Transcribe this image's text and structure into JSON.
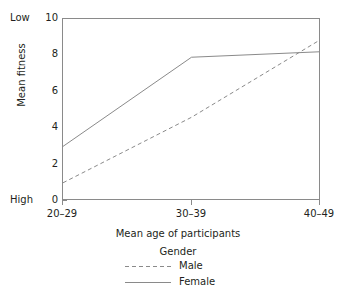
{
  "chart_data": {
    "type": "line",
    "title": "",
    "xlabel": "Mean age of participants",
    "ylabel": "Mean fitness",
    "categories": [
      "20–29",
      "30–39",
      "40–49"
    ],
    "yticks": [
      0,
      2,
      4,
      6,
      8,
      10
    ],
    "ylim": [
      0,
      10
    ],
    "grid": false,
    "axis_annotations": {
      "y_top": "Low",
      "y_bottom": "High"
    },
    "legend": {
      "title": "Gender",
      "position": "below-axes",
      "entries": [
        {
          "name": "Male",
          "style": "dashed"
        },
        {
          "name": "Female",
          "style": "solid"
        }
      ]
    },
    "series": [
      {
        "name": "Male",
        "style": "dashed",
        "color": "#8a8a8a",
        "values": [
          1.0,
          4.6,
          8.85
        ]
      },
      {
        "name": "Female",
        "style": "solid",
        "color": "#8a8a8a",
        "values": [
          3.0,
          7.9,
          8.2
        ]
      }
    ]
  },
  "colors": {
    "axis": "#8a8a8a",
    "text": "#231f20",
    "background": "#ffffff"
  }
}
